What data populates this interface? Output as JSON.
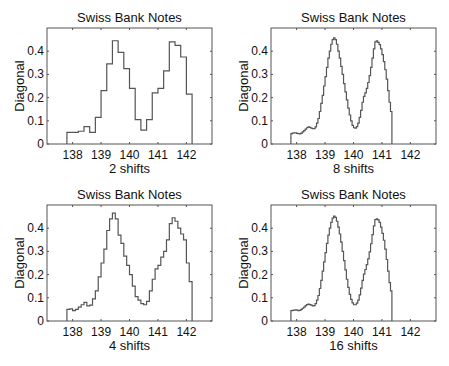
{
  "figure": {
    "panels": [
      {
        "id": "p2",
        "title": "Swiss Bank Notes",
        "xlabel": "2 shifts",
        "ylabel": "Diagonal"
      },
      {
        "id": "p8",
        "title": "Swiss Bank Notes",
        "xlabel": "8 shifts",
        "ylabel": "Diagonal"
      },
      {
        "id": "p4",
        "title": "Swiss Bank Notes",
        "xlabel": "4 shifts",
        "ylabel": "Diagonal"
      },
      {
        "id": "p16",
        "title": "Swiss Bank Notes",
        "xlabel": "16 shifts",
        "ylabel": "Diagonal"
      }
    ],
    "xticks": [
      "138",
      "139",
      "140",
      "141",
      "142"
    ],
    "yticks": [
      "0",
      "0.1",
      "0.2",
      "0.3",
      "0.4"
    ],
    "line_color": "#555555"
  },
  "chart_data": [
    {
      "type": "line",
      "style": "step",
      "title": "Swiss Bank Notes",
      "xlabel": "2 shifts",
      "ylabel": "Diagonal",
      "xlim": [
        137.1,
        142.9
      ],
      "ylim": [
        0,
        0.5
      ],
      "xticks": [
        138,
        139,
        140,
        141,
        142
      ],
      "yticks": [
        0,
        0.1,
        0.2,
        0.3,
        0.4
      ],
      "x_start": 137.8,
      "bin_width": 0.2,
      "values": [
        0.05,
        0.05,
        0.055,
        0.075,
        0.05,
        0.115,
        0.23,
        0.345,
        0.445,
        0.395,
        0.325,
        0.24,
        0.105,
        0.06,
        0.105,
        0.22,
        0.24,
        0.315,
        0.44,
        0.425,
        0.375,
        0.215
      ]
    },
    {
      "type": "line",
      "style": "step",
      "title": "Swiss Bank Notes",
      "xlabel": "8 shifts",
      "ylabel": "Diagonal",
      "xlim": [
        137.1,
        142.9
      ],
      "ylim": [
        0,
        0.5
      ],
      "xticks": [
        138,
        139,
        140,
        141,
        142
      ],
      "yticks": [
        0,
        0.1,
        0.2,
        0.3,
        0.4
      ],
      "x_start": 137.8,
      "bin_width": 0.05,
      "values": [
        0.045,
        0.047,
        0.048,
        0.048,
        0.046,
        0.045,
        0.044,
        0.047,
        0.052,
        0.058,
        0.064,
        0.07,
        0.074,
        0.072,
        0.068,
        0.066,
        0.066,
        0.074,
        0.09,
        0.11,
        0.14,
        0.175,
        0.21,
        0.25,
        0.29,
        0.33,
        0.37,
        0.4,
        0.43,
        0.45,
        0.458,
        0.45,
        0.43,
        0.4,
        0.37,
        0.335,
        0.3,
        0.26,
        0.225,
        0.19,
        0.155,
        0.125,
        0.1,
        0.08,
        0.07,
        0.068,
        0.075,
        0.09,
        0.115,
        0.145,
        0.18,
        0.205,
        0.22,
        0.24,
        0.265,
        0.295,
        0.33,
        0.37,
        0.41,
        0.44,
        0.445,
        0.438,
        0.428,
        0.41,
        0.385,
        0.355,
        0.32,
        0.28,
        0.23,
        0.18,
        0.14
      ]
    },
    {
      "type": "line",
      "style": "step",
      "title": "Swiss Bank Notes",
      "xlabel": "4 shifts",
      "ylabel": "Diagonal",
      "xlim": [
        137.1,
        142.9
      ],
      "ylim": [
        0,
        0.5
      ],
      "xticks": [
        138,
        139,
        140,
        141,
        142
      ],
      "yticks": [
        0,
        0.1,
        0.2,
        0.3,
        0.4
      ],
      "x_start": 137.8,
      "bin_width": 0.1,
      "values": [
        0.05,
        0.052,
        0.045,
        0.05,
        0.06,
        0.07,
        0.08,
        0.065,
        0.068,
        0.095,
        0.13,
        0.19,
        0.25,
        0.31,
        0.39,
        0.44,
        0.465,
        0.44,
        0.37,
        0.335,
        0.28,
        0.24,
        0.2,
        0.15,
        0.105,
        0.09,
        0.075,
        0.07,
        0.085,
        0.13,
        0.18,
        0.225,
        0.24,
        0.275,
        0.3,
        0.35,
        0.42,
        0.445,
        0.43,
        0.4,
        0.375,
        0.35,
        0.25,
        0.17
      ]
    },
    {
      "type": "line",
      "style": "smooth-step",
      "title": "Swiss Bank Notes",
      "xlabel": "16 shifts",
      "ylabel": "Diagonal",
      "xlim": [
        137.1,
        142.9
      ],
      "ylim": [
        0,
        0.5
      ],
      "xticks": [
        138,
        139,
        140,
        141,
        142
      ],
      "yticks": [
        0,
        0.1,
        0.2,
        0.3,
        0.4
      ],
      "x_start": 137.8,
      "bin_width": 0.05,
      "values": [
        0.045,
        0.046,
        0.047,
        0.048,
        0.047,
        0.045,
        0.046,
        0.05,
        0.055,
        0.06,
        0.066,
        0.071,
        0.073,
        0.071,
        0.068,
        0.065,
        0.066,
        0.075,
        0.09,
        0.11,
        0.14,
        0.175,
        0.215,
        0.255,
        0.295,
        0.335,
        0.37,
        0.4,
        0.425,
        0.443,
        0.452,
        0.447,
        0.43,
        0.405,
        0.375,
        0.34,
        0.3,
        0.26,
        0.22,
        0.18,
        0.145,
        0.115,
        0.093,
        0.078,
        0.07,
        0.07,
        0.077,
        0.09,
        0.113,
        0.142,
        0.175,
        0.202,
        0.222,
        0.243,
        0.268,
        0.298,
        0.333,
        0.372,
        0.41,
        0.437,
        0.44,
        0.436,
        0.425,
        0.405,
        0.378,
        0.348,
        0.31,
        0.265,
        0.215,
        0.165,
        0.13
      ]
    }
  ]
}
